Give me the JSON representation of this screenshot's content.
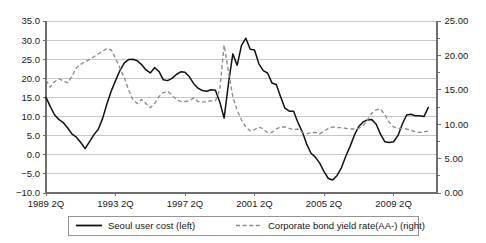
{
  "chart_data": {
    "type": "line",
    "title": "",
    "xlabel": "",
    "ylabel": "",
    "grid": true,
    "legend_position": "bottom",
    "x_tick_labels": [
      "1989 2Q",
      "1993 2Q",
      "1997 2Q",
      "2001 2Q",
      "2005 2Q",
      "2009 2Q"
    ],
    "x_tick_quarter_index": [
      0,
      16,
      32,
      48,
      64,
      80
    ],
    "x_range_quarters": [
      0,
      90
    ],
    "left_axis": {
      "label": "Seoul user cost (left)",
      "ylim": [
        -10.0,
        35.0
      ],
      "tick_step": 5.0,
      "tick_labels": [
        "35.0",
        "30.0",
        "25.0",
        "20.0",
        "15.0",
        "10.0",
        "5.0",
        "0.0",
        "-5.0",
        "-10.0"
      ],
      "tick_values": [
        35.0,
        30.0,
        25.0,
        20.0,
        15.0,
        10.0,
        5.0,
        0.0,
        -5.0,
        -10.0
      ]
    },
    "right_axis": {
      "label": "Corporate bond yield rate(AA-) (right)",
      "ylim": [
        0.0,
        25.0
      ],
      "tick_step": 5.0,
      "minor_tick_step": 2.5,
      "tick_labels": [
        "25.00",
        "20.00",
        "15.00",
        "10.00",
        "5.00",
        "0.00"
      ],
      "tick_values": [
        25.0,
        20.0,
        15.0,
        10.0,
        5.0,
        0.0
      ]
    },
    "series": [
      {
        "name": "Seoul user cost (left)",
        "axis": "left",
        "style": "solid",
        "color": "#111111",
        "x": [
          0,
          1,
          2,
          3,
          4,
          5,
          6,
          7,
          8,
          9,
          10,
          11,
          12,
          13,
          14,
          15,
          16,
          17,
          18,
          19,
          20,
          21,
          22,
          23,
          24,
          25,
          26,
          27,
          28,
          29,
          30,
          31,
          32,
          33,
          34,
          35,
          36,
          37,
          38,
          39,
          40,
          41,
          42,
          43,
          44,
          45,
          46,
          47,
          48,
          49,
          50,
          51,
          52,
          53,
          54,
          55,
          56,
          57,
          58,
          59,
          60,
          61,
          62,
          63,
          64,
          65,
          66,
          67,
          68,
          69,
          70,
          71,
          72,
          73,
          74,
          75,
          76,
          77,
          78,
          79,
          80,
          81,
          82,
          83,
          84,
          85,
          86,
          87,
          88
        ],
        "values": [
          15.0,
          12.6,
          10.4,
          9.2,
          8.4,
          7.0,
          5.4,
          4.6,
          3.2,
          1.6,
          3.4,
          5.2,
          6.6,
          9.4,
          13.2,
          16.6,
          19.4,
          22.0,
          24.0,
          24.9,
          25.0,
          24.6,
          23.6,
          22.2,
          21.4,
          22.8,
          21.8,
          19.6,
          19.4,
          20.0,
          21.0,
          21.7,
          21.6,
          20.4,
          18.6,
          17.4,
          16.8,
          16.6,
          17.0,
          16.9,
          13.8,
          9.6,
          18.6,
          26.4,
          23.4,
          28.6,
          30.5,
          27.6,
          27.4,
          23.8,
          22.0,
          21.4,
          18.8,
          18.4,
          15.2,
          12.2,
          11.4,
          11.4,
          8.4,
          6.0,
          2.8,
          0.4,
          -0.6,
          -2.2,
          -4.4,
          -6.2,
          -6.6,
          -5.4,
          -3.4,
          -0.4,
          2.2,
          5.2,
          7.4,
          8.6,
          9.1,
          9.2,
          8.0,
          5.4,
          3.4,
          3.2,
          3.4,
          5.0,
          8.0,
          10.4,
          10.6,
          10.2,
          10.2,
          10.0,
          12.4
        ]
      },
      {
        "name": "Corporate bond yield rate(AA-) (right)",
        "axis": "right",
        "style": "dashed",
        "color": "#8c8c8c",
        "x": [
          0,
          1,
          2,
          3,
          4,
          5,
          6,
          7,
          8,
          9,
          10,
          11,
          12,
          13,
          14,
          15,
          16,
          17,
          18,
          19,
          20,
          21,
          22,
          23,
          24,
          25,
          26,
          27,
          28,
          29,
          30,
          31,
          32,
          33,
          34,
          35,
          36,
          37,
          38,
          39,
          40,
          41,
          42,
          43,
          44,
          45,
          46,
          47,
          48,
          49,
          50,
          51,
          52,
          53,
          54,
          55,
          56,
          57,
          58,
          59,
          60,
          61,
          62,
          63,
          64,
          65,
          66,
          67,
          68,
          69,
          70,
          71,
          72,
          73,
          74,
          75,
          76,
          77,
          78,
          79,
          80,
          81,
          82,
          83,
          84,
          85,
          86,
          87,
          88
        ],
        "values": [
          16.4,
          15.4,
          16.2,
          16.6,
          16.3,
          16.0,
          17.0,
          18.2,
          18.7,
          19.1,
          19.4,
          19.8,
          20.2,
          20.6,
          21.0,
          20.8,
          19.6,
          18.2,
          16.8,
          15.0,
          13.6,
          13.0,
          13.6,
          13.0,
          12.4,
          13.0,
          14.0,
          14.6,
          14.8,
          14.2,
          13.6,
          13.3,
          13.3,
          13.4,
          13.8,
          13.3,
          13.2,
          13.3,
          13.4,
          13.4,
          15.0,
          21.5,
          17.6,
          14.0,
          12.0,
          10.6,
          9.6,
          9.0,
          9.2,
          9.6,
          9.3,
          8.8,
          8.8,
          9.3,
          9.6,
          9.6,
          9.4,
          9.2,
          9.3,
          8.8,
          8.6,
          8.8,
          8.8,
          8.6,
          9.0,
          9.4,
          9.6,
          9.5,
          9.5,
          9.4,
          9.3,
          9.3,
          9.4,
          9.8,
          10.6,
          11.6,
          12.1,
          12.2,
          11.4,
          10.3,
          9.6,
          9.4,
          9.4,
          9.3,
          9.1,
          8.9,
          8.8,
          8.9,
          9.0
        ]
      }
    ]
  },
  "legend": {
    "items": [
      {
        "label": "Seoul user cost (left)",
        "style": "solid"
      },
      {
        "label": "Corporate bond yield rate(AA-) (right)",
        "style": "dashed"
      }
    ]
  }
}
